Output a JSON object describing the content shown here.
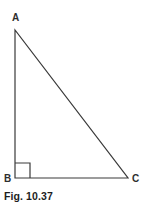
{
  "figure": {
    "caption": "Fig. 10.37",
    "background_color": "#ffffff",
    "stroke_color": "#3a3a3a",
    "label_color": "#2e2e2e",
    "caption_color": "#1d1d1d"
  },
  "diagram": {
    "type": "right-triangle",
    "vertices": [
      {
        "name": "A",
        "label": "A",
        "x": 15,
        "y": 30
      },
      {
        "name": "B",
        "label": "B",
        "x": 15,
        "y": 178
      },
      {
        "name": "C",
        "label": "C",
        "x": 128,
        "y": 178
      }
    ],
    "edges": [
      {
        "name": "AB",
        "from": "A",
        "to": "B"
      },
      {
        "name": "BC",
        "from": "B",
        "to": "C"
      },
      {
        "name": "AC",
        "from": "A",
        "to": "C"
      }
    ],
    "right_angle": {
      "at_vertex": "B",
      "marker": "square",
      "size": 15
    }
  }
}
